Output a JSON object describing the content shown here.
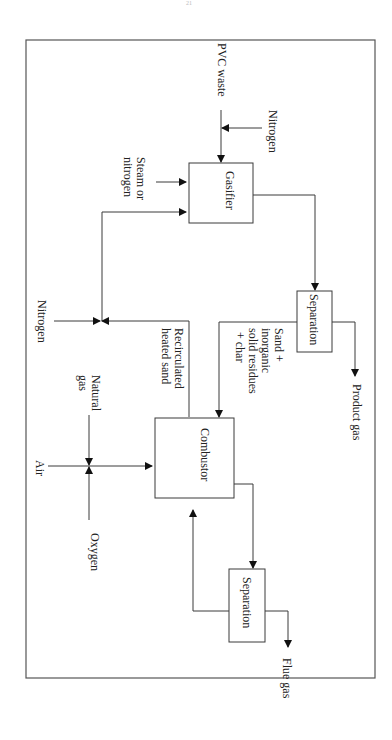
{
  "page_mark": "21",
  "diagram": {
    "title": "",
    "nodes": [
      {
        "id": "gasifier",
        "label": "Gasifier"
      },
      {
        "id": "separation1",
        "label": "Separation"
      },
      {
        "id": "combustor",
        "label": "Combustor"
      },
      {
        "id": "separation2",
        "label": "Separation"
      }
    ],
    "streams": {
      "pvc_waste": "PVC waste",
      "nitrogen_top": "Nitrogen",
      "steam_1": "Steam or",
      "steam_2": "nitrogen",
      "product_gas": "Product gas",
      "sand_1": "Sand +",
      "sand_2": "inorganic",
      "sand_3": "solid residues",
      "sand_4": "+ char",
      "recirc_1": "Recirculated",
      "recirc_2": "heated sand",
      "nitrogen_left": "Nitrogen",
      "natural_gas_1": "Natural",
      "natural_gas_2": "gas",
      "air": "Air",
      "oxygen": "Oxygen",
      "flue_gas": "Flue gas"
    },
    "edges": [
      {
        "from": "pvc_waste",
        "to": "gasifier"
      },
      {
        "from": "nitrogen_top",
        "to": "pvc_waste_line"
      },
      {
        "from": "steam_or_nitrogen",
        "to": "gasifier"
      },
      {
        "from": "gasifier",
        "to": "separation1"
      },
      {
        "from": "separation1",
        "to": "product_gas"
      },
      {
        "from": "separation1",
        "to": "combustor",
        "label": "Sand + inorganic solid residues + char"
      },
      {
        "from": "combustor",
        "to": "gasifier",
        "label": "Recirculated heated sand"
      },
      {
        "from": "nitrogen_left",
        "to": "recirculation_line"
      },
      {
        "from": "natural_gas",
        "to": "combustor"
      },
      {
        "from": "air",
        "to": "combustor"
      },
      {
        "from": "oxygen",
        "to": "combustor"
      },
      {
        "from": "combustor",
        "to": "separation2"
      },
      {
        "from": "separation2",
        "to": "combustor"
      },
      {
        "from": "separation2",
        "to": "flue_gas"
      }
    ]
  }
}
